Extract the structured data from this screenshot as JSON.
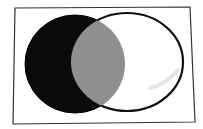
{
  "diagram": {
    "type": "venn",
    "sets": [
      {
        "id": "left-set",
        "fill": "#0a0a0a",
        "stroke": "#000000"
      },
      {
        "id": "right-set",
        "fill": "#ffffff",
        "stroke": "#111111"
      }
    ],
    "intersection": {
      "fill": "#8f8f8f"
    },
    "frame": {
      "stroke": "#333333",
      "fill": "#ffffff"
    }
  }
}
